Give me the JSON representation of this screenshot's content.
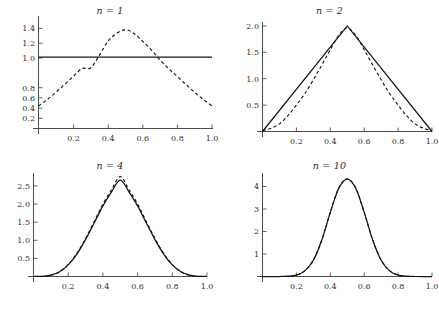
{
  "figure": {
    "background": "#ffffff",
    "layout": "2x2 grid of line plots",
    "curve_colors": {
      "solid": "#161616",
      "dashed": "#161616"
    }
  },
  "panels": [
    {
      "id": "n1",
      "title_var": "n",
      "title_eq": " = ",
      "title_val": "1",
      "title": "n = 1"
    },
    {
      "id": "n2",
      "title_var": "n",
      "title_eq": " = ",
      "title_val": "2",
      "title": "n = 2"
    },
    {
      "id": "n4",
      "title_var": "n",
      "title_eq": " = ",
      "title_val": "4",
      "title": "n = 4"
    },
    {
      "id": "n10",
      "title_var": "n",
      "title_eq": " = ",
      "title_val": "10",
      "title": "n = 10"
    }
  ],
  "chart_data": [
    {
      "type": "line",
      "title": "n = 1",
      "xlabel": "",
      "ylabel": "",
      "xlim": [
        0.0,
        1.0
      ],
      "ylim": [
        0.0,
        1.45
      ],
      "grid": false,
      "legend": "none",
      "xticks": [
        0.2,
        0.4,
        0.6,
        0.8,
        1.0
      ],
      "xticklabels": [
        "0.2",
        "0.4",
        "0.6",
        "0.8",
        "1.0"
      ],
      "yticks": [
        0.2,
        0.4,
        0.6,
        0.8,
        1.0,
        1.2,
        1.4
      ],
      "yticklabels": [
        "0.2",
        "0.4",
        "0.6",
        "0.8",
        "1.0",
        "1.2",
        "1.4"
      ],
      "series": [
        {
          "name": "exact density (solid)",
          "style": "solid",
          "x": [
            0.0,
            0.1,
            0.2,
            0.3,
            0.4,
            0.5,
            0.6,
            0.7,
            0.8,
            0.9,
            1.0
          ],
          "values": [
            1.0,
            1.0,
            1.0,
            1.0,
            1.0,
            1.0,
            1.0,
            1.0,
            1.0,
            1.0,
            1.0
          ]
        },
        {
          "name": "normal approximation (dashed)",
          "style": "dashed",
          "x": [
            0.0,
            0.05,
            0.1,
            0.15,
            0.2,
            0.25,
            0.3,
            0.35,
            0.4,
            0.45,
            0.5,
            0.55,
            0.6,
            0.65,
            0.7,
            0.75,
            0.8,
            0.85,
            0.9,
            0.95,
            1.0
          ],
          "values": [
            0.315,
            0.405,
            0.505,
            0.615,
            0.727,
            0.838,
            0.847,
            1.02,
            1.22,
            1.33,
            1.382,
            1.33,
            1.22,
            1.1,
            0.96,
            0.838,
            0.727,
            0.615,
            0.505,
            0.405,
            0.315
          ]
        }
      ]
    },
    {
      "type": "line",
      "title": "n = 2",
      "xlabel": "",
      "ylabel": "",
      "xlim": [
        0.0,
        1.0
      ],
      "ylim": [
        0.0,
        2.1
      ],
      "grid": false,
      "legend": "none",
      "xticks": [
        0.2,
        0.4,
        0.6,
        0.8,
        1.0
      ],
      "xticklabels": [
        "0.2",
        "0.4",
        "0.6",
        "0.8",
        "1.0"
      ],
      "yticks": [
        0.5,
        1.0,
        1.5,
        2.0
      ],
      "yticklabels": [
        "0.5",
        "1.0",
        "1.5",
        "2.0"
      ],
      "series": [
        {
          "name": "exact density (solid)",
          "style": "solid",
          "x": [
            0.0,
            0.5,
            1.0
          ],
          "values": [
            0.0,
            2.0,
            0.0
          ]
        },
        {
          "name": "normal approximation (dashed)",
          "style": "dashed",
          "x": [
            0.0,
            0.05,
            0.1,
            0.15,
            0.2,
            0.25,
            0.3,
            0.35,
            0.4,
            0.45,
            0.5,
            0.55,
            0.6,
            0.65,
            0.7,
            0.75,
            0.8,
            0.85,
            0.9,
            0.95,
            1.0
          ],
          "values": [
            0.018,
            0.06,
            0.145,
            0.3,
            0.5,
            0.72,
            0.98,
            1.26,
            1.55,
            1.82,
            1.96,
            1.82,
            1.55,
            1.26,
            0.98,
            0.72,
            0.5,
            0.3,
            0.145,
            0.06,
            0.018
          ]
        }
      ]
    },
    {
      "type": "line",
      "title": "n = 4",
      "xlabel": "",
      "ylabel": "",
      "xlim": [
        0.0,
        1.0
      ],
      "ylim": [
        0.0,
        2.8
      ],
      "grid": false,
      "legend": "none",
      "xticks": [
        0.2,
        0.4,
        0.6,
        0.8,
        1.0
      ],
      "xticklabels": [
        "0.2",
        "0.4",
        "0.6",
        "0.8",
        "1.0"
      ],
      "yticks": [
        0.5,
        1.0,
        1.5,
        2.0,
        2.5
      ],
      "yticklabels": [
        "0.5",
        "1.0",
        "1.5",
        "2.0",
        "2.5"
      ],
      "series": [
        {
          "name": "exact density (solid)",
          "style": "solid",
          "x": [
            0.0,
            0.05,
            0.1,
            0.15,
            0.2,
            0.25,
            0.3,
            0.35,
            0.4,
            0.45,
            0.5,
            0.55,
            0.6,
            0.65,
            0.7,
            0.75,
            0.8,
            0.85,
            0.9,
            0.95,
            1.0
          ],
          "values": [
            0.0,
            0.005,
            0.04,
            0.13,
            0.32,
            0.62,
            1.02,
            1.48,
            1.95,
            2.34,
            2.66,
            2.34,
            1.95,
            1.48,
            1.02,
            0.62,
            0.32,
            0.13,
            0.04,
            0.005,
            0.0
          ]
        },
        {
          "name": "normal approximation (dashed)",
          "style": "dashed",
          "x": [
            0.0,
            0.05,
            0.1,
            0.15,
            0.2,
            0.25,
            0.3,
            0.35,
            0.4,
            0.45,
            0.5,
            0.55,
            0.6,
            0.65,
            0.7,
            0.75,
            0.8,
            0.85,
            0.9,
            0.95,
            1.0
          ],
          "values": [
            0.0,
            0.004,
            0.035,
            0.125,
            0.33,
            0.64,
            1.05,
            1.52,
            2.0,
            2.4,
            2.76,
            2.4,
            2.0,
            1.52,
            1.05,
            0.64,
            0.33,
            0.125,
            0.035,
            0.004,
            0.0
          ]
        }
      ]
    },
    {
      "type": "line",
      "title": "n = 10",
      "xlabel": "",
      "ylabel": "",
      "xlim": [
        0.0,
        1.0
      ],
      "ylim": [
        0.0,
        4.5
      ],
      "grid": false,
      "legend": "none",
      "xticks": [
        0.2,
        0.4,
        0.6,
        0.8,
        1.0
      ],
      "xticklabels": [
        "0.2",
        "0.4",
        "0.6",
        "0.8",
        "1.0"
      ],
      "yticks": [
        1,
        2,
        3,
        4
      ],
      "yticklabels": [
        "1",
        "2",
        "3",
        "4"
      ],
      "series": [
        {
          "name": "exact density (solid)",
          "style": "solid",
          "x": [
            0.0,
            0.1,
            0.15,
            0.2,
            0.25,
            0.3,
            0.35,
            0.4,
            0.45,
            0.5,
            0.55,
            0.6,
            0.65,
            0.7,
            0.75,
            0.8,
            0.85,
            0.9,
            1.0
          ],
          "values": [
            0.0,
            0.0,
            0.01,
            0.06,
            0.25,
            0.72,
            1.62,
            2.85,
            3.92,
            4.33,
            3.92,
            2.85,
            1.62,
            0.72,
            0.25,
            0.06,
            0.01,
            0.0,
            0.0
          ]
        },
        {
          "name": "normal approximation (dashed)",
          "style": "dashed",
          "x": [
            0.0,
            0.1,
            0.15,
            0.2,
            0.25,
            0.3,
            0.35,
            0.4,
            0.45,
            0.5,
            0.55,
            0.6,
            0.65,
            0.7,
            0.75,
            0.8,
            0.85,
            0.9,
            1.0
          ],
          "values": [
            0.0,
            0.0,
            0.012,
            0.065,
            0.26,
            0.73,
            1.63,
            2.86,
            3.93,
            4.34,
            3.93,
            2.86,
            1.63,
            0.73,
            0.26,
            0.065,
            0.012,
            0.0,
            0.0
          ]
        }
      ]
    }
  ]
}
